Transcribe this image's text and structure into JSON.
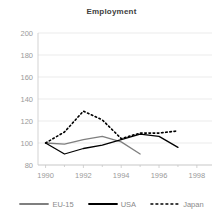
{
  "chart_data": {
    "type": "line",
    "title": "Employment",
    "xlabel": "",
    "ylabel": "",
    "x": [
      1990,
      1991,
      1992,
      1993,
      1994,
      1995,
      1996,
      1997
    ],
    "xlim": [
      1989.6,
      1998.8
    ],
    "ylim": [
      80,
      200
    ],
    "yticks": [
      80,
      100,
      120,
      140,
      160,
      180,
      200
    ],
    "xticks": [
      1990,
      1992,
      1994,
      1996,
      1998
    ],
    "ytick_labels": [
      "80",
      "100",
      "120",
      "140",
      "160",
      "180",
      "200"
    ],
    "xtick_labels": [
      "1990",
      "1992",
      "1994",
      "1996",
      "1998"
    ],
    "grid": true,
    "legend_position": "bottom",
    "series": [
      {
        "name": "EU-15",
        "style": "solid",
        "color": "#7f7f7f",
        "x": [
          1990,
          1991,
          1992,
          1993,
          1994,
          1995
        ],
        "values": [
          100,
          99,
          103,
          106,
          101,
          90
        ]
      },
      {
        "name": "USA",
        "style": "solid",
        "color": "#000000",
        "x": [
          1990,
          1991,
          1992,
          1993,
          1994,
          1995,
          1996,
          1997
        ],
        "values": [
          100,
          90,
          95,
          98,
          103,
          108,
          106,
          96
        ]
      },
      {
        "name": "Japan",
        "style": "dashed",
        "color": "#000000",
        "x": [
          1990,
          1991,
          1992,
          1993,
          1994,
          1995,
          1996,
          1997
        ],
        "values": [
          100,
          110,
          129,
          121,
          104,
          109,
          109,
          111
        ]
      }
    ]
  },
  "legend": {
    "items": [
      {
        "label": "EU-15",
        "color": "#7f7f7f",
        "style": "solid"
      },
      {
        "label": "USA",
        "color": "#000000",
        "style": "solid"
      },
      {
        "label": "Japan",
        "color": "#000000",
        "style": "dashed"
      }
    ]
  }
}
